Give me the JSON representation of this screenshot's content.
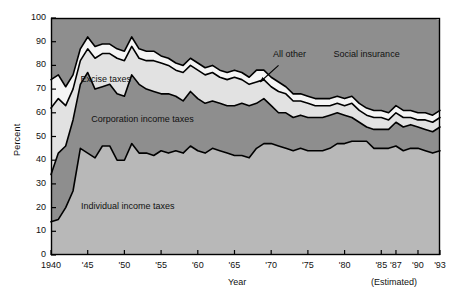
{
  "chart_data": {
    "type": "area",
    "stacked": true,
    "title": "",
    "subtitle": "",
    "xlabel": "Year",
    "ylabel": "Percent",
    "ylim": [
      0,
      100
    ],
    "xlim": [
      1940,
      1993
    ],
    "grid": false,
    "legend_position": "inline-labels",
    "annotations": [
      {
        "text": "(Estimated)",
        "x": 1989,
        "y": -14,
        "note": "below axis at right"
      },
      {
        "text": "All other",
        "x": 1971,
        "y": 83,
        "leader": true,
        "leader_from": [
          1971,
          80
        ],
        "leader_to": [
          1968.5,
          73
        ]
      }
    ],
    "ticks": {
      "y": [
        0,
        10,
        20,
        30,
        40,
        50,
        60,
        70,
        80,
        90,
        100
      ],
      "x_values": [
        1940,
        1945,
        1950,
        1955,
        1960,
        1965,
        1970,
        1975,
        1980,
        1985,
        1987,
        1990,
        1993
      ],
      "x_labels": [
        "1940",
        "'45",
        "'50",
        "'55",
        "'60",
        "'65",
        "'70",
        "'75",
        "'80",
        "'85",
        "'87",
        "'90",
        "'93"
      ]
    },
    "x": [
      1940,
      1941,
      1942,
      1943,
      1944,
      1945,
      1946,
      1947,
      1948,
      1949,
      1950,
      1951,
      1952,
      1953,
      1954,
      1955,
      1956,
      1957,
      1958,
      1959,
      1960,
      1961,
      1962,
      1963,
      1964,
      1965,
      1966,
      1967,
      1968,
      1969,
      1970,
      1971,
      1972,
      1973,
      1974,
      1975,
      1976,
      1977,
      1978,
      1979,
      1980,
      1981,
      1982,
      1983,
      1984,
      1985,
      1986,
      1987,
      1988,
      1989,
      1990,
      1991,
      1992,
      1993
    ],
    "series": [
      {
        "name": "Individual income taxes",
        "color": "#b8b8b8",
        "label_x": 1950,
        "label_y": 20,
        "values": [
          14,
          15,
          20,
          27,
          45,
          43,
          41,
          46,
          46,
          40,
          40,
          47,
          43,
          43,
          42,
          44,
          43,
          44,
          43,
          46,
          44,
          43,
          45,
          44,
          43,
          42,
          42,
          41,
          45,
          47,
          47,
          46,
          45,
          44,
          45,
          44,
          44,
          44,
          45,
          47,
          47,
          48,
          48,
          48,
          45,
          45,
          45,
          46,
          44,
          45,
          45,
          44,
          43,
          44
        ]
      },
      {
        "name": "Corporation income taxes",
        "color": "#8e8e8e",
        "label_x": 1952,
        "label_y": 57,
        "values": [
          20,
          28,
          26,
          30,
          27,
          34,
          29,
          25,
          26,
          28,
          27,
          29,
          29,
          27,
          27,
          24,
          25,
          23,
          22,
          23,
          22,
          21,
          20,
          20,
          20,
          21,
          22,
          22,
          19,
          19,
          16,
          14,
          15,
          14,
          14,
          14,
          14,
          14,
          14,
          13,
          12,
          10,
          8,
          6,
          8,
          8,
          8,
          10,
          10,
          10,
          9,
          9,
          9,
          10
        ]
      },
      {
        "name": "Excise taxes",
        "color": "#e2e2e2",
        "label_x": 1947,
        "label_y": 73,
        "values": [
          28,
          23,
          17,
          13,
          10,
          10,
          13,
          14,
          13,
          15,
          15,
          12,
          11,
          12,
          13,
          13,
          12,
          11,
          12,
          11,
          12,
          12,
          12,
          11,
          11,
          12,
          10,
          9,
          9,
          8,
          8,
          9,
          8,
          7,
          6,
          6,
          5,
          5,
          4,
          4,
          4,
          6,
          5,
          5,
          5,
          5,
          4,
          4,
          4,
          3,
          3,
          4,
          4,
          4
        ]
      },
      {
        "name": "All other",
        "color": "#f5f5f5",
        "label_x": 1971,
        "label_y": 83,
        "values": [
          12,
          10,
          8,
          6,
          5,
          5,
          5,
          4,
          4,
          4,
          4,
          4,
          4,
          4,
          4,
          3,
          3,
          3,
          3,
          3,
          3,
          3,
          3,
          3,
          3,
          3,
          3,
          3,
          5,
          4,
          4,
          4,
          3,
          3,
          3,
          3,
          3,
          3,
          3,
          3,
          3,
          3,
          3,
          3,
          3,
          3,
          3,
          3,
          3,
          3,
          3,
          3,
          3,
          3
        ]
      },
      {
        "name": "Social insurance",
        "color": "#8e8e8e",
        "label_x": 1980,
        "label_y": 82,
        "values": [
          26,
          24,
          29,
          24,
          13,
          8,
          12,
          11,
          11,
          13,
          14,
          8,
          13,
          14,
          14,
          16,
          17,
          19,
          20,
          17,
          19,
          21,
          20,
          22,
          23,
          22,
          23,
          25,
          22,
          22,
          25,
          27,
          29,
          32,
          32,
          33,
          34,
          34,
          34,
          33,
          34,
          33,
          36,
          38,
          39,
          39,
          40,
          37,
          39,
          39,
          40,
          40,
          41,
          38
        ]
      }
    ]
  },
  "geometry": {
    "plot_left": 51,
    "plot_right": 440,
    "plot_top": 18,
    "plot_bottom": 255
  },
  "axis": {
    "ylabel_text": "Percent",
    "xlabel_text": "Year",
    "estimated_note": "(Estimated)"
  },
  "ytick_labels": [
    "100",
    "90",
    "80",
    "70",
    "60",
    "50",
    "40",
    "30",
    "20",
    "10",
    "0"
  ],
  "xtick_labels": [
    "1940",
    "'45",
    "'50",
    "'55",
    "'60",
    "'65",
    "'70",
    "'75",
    "'80",
    "'85",
    "'87",
    "'90",
    "'93"
  ],
  "band_labels": {
    "individual": "Individual income taxes",
    "corporation": "Corporation income taxes",
    "excise": "Excise taxes",
    "all_other": "All other",
    "social": "Social insurance"
  },
  "colors": {
    "individual": "#b8b8b8",
    "corporation": "#8e8e8e",
    "excise": "#e2e2e2",
    "all_other": "#f5f5f5",
    "social": "#8e8e8e",
    "outline": "#000000",
    "text": "#111111",
    "background": "#ffffff"
  }
}
